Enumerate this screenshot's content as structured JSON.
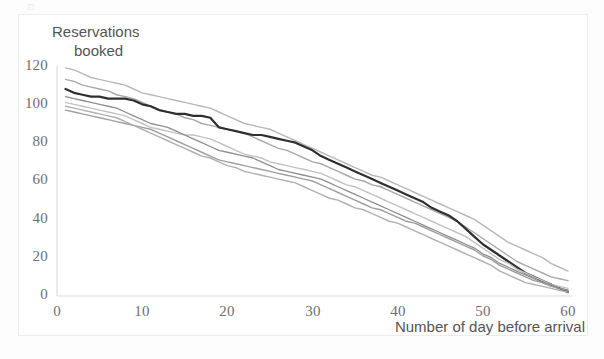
{
  "figure": {
    "scan_artifact": "□"
  },
  "chart_data": {
    "type": "line",
    "title": "Reservations booked",
    "title_line1": "Reservations",
    "title_line2": "booked",
    "xlabel": "Number of day before arrival",
    "ylabel": "Reservations booked",
    "xlim": [
      0,
      60
    ],
    "ylim": [
      0,
      120
    ],
    "xticks": [
      0,
      10,
      20,
      30,
      40,
      50,
      60
    ],
    "yticks": [
      0,
      20,
      40,
      60,
      80,
      100,
      120
    ],
    "grid": false,
    "legend": "none",
    "x": [
      1,
      2,
      3,
      4,
      5,
      6,
      7,
      8,
      9,
      10,
      11,
      12,
      13,
      14,
      15,
      16,
      17,
      18,
      19,
      20,
      21,
      22,
      23,
      24,
      25,
      26,
      27,
      28,
      29,
      30,
      31,
      32,
      33,
      34,
      35,
      36,
      37,
      38,
      39,
      40,
      41,
      42,
      43,
      44,
      45,
      46,
      47,
      48,
      49,
      50,
      51,
      52,
      53,
      54,
      55,
      56,
      57,
      58,
      59,
      60
    ],
    "colors": {
      "highlight": "#2f2f2f",
      "series_gray_1": "#b8b8b8",
      "series_gray_2": "#a8a8a8",
      "series_gray_3": "#c2c2c2",
      "series_gray_4": "#9e9e9e",
      "series_gray_5": "#b0b0b0",
      "series_gray_6": "#8f8f8f",
      "axis": "#d9d9d9",
      "tick_text": "#6e6e6e",
      "frame": "#ececec"
    },
    "series": [
      {
        "name": "booking curve 1 (upper)",
        "color": "#b8b8b8",
        "width": 1.4,
        "values": [
          119,
          118,
          116,
          114,
          113,
          112,
          111,
          110,
          108,
          106,
          105,
          104,
          103,
          102,
          101,
          100,
          99,
          98,
          96,
          94,
          92,
          90,
          89,
          88,
          87,
          85,
          83,
          81,
          79,
          77,
          75,
          73,
          71,
          69,
          67,
          65,
          63,
          62,
          60,
          58,
          56,
          54,
          52,
          50,
          48,
          46,
          44,
          42,
          40,
          37,
          34,
          31,
          28,
          26,
          24,
          22,
          20,
          17,
          15,
          13
        ]
      },
      {
        "name": "booking curve 2",
        "color": "#a8a8a8",
        "width": 1.4,
        "values": [
          113,
          112,
          110,
          109,
          108,
          107,
          105,
          104,
          103,
          101,
          99,
          97,
          96,
          95,
          93,
          92,
          90,
          89,
          88,
          87,
          86,
          85,
          83,
          81,
          79,
          77,
          76,
          74,
          72,
          70,
          69,
          67,
          65,
          63,
          61,
          60,
          58,
          57,
          55,
          53,
          51,
          49,
          47,
          45,
          43,
          41,
          39,
          36,
          33,
          30,
          27,
          24,
          21,
          18,
          16,
          14,
          12,
          10,
          9,
          8
        ]
      },
      {
        "name": "booking curve 3 (highlight / average)",
        "color": "#2f2f2f",
        "width": 2.2,
        "highlight": true,
        "values": [
          108,
          106,
          105,
          104,
          104,
          103,
          103,
          103,
          102,
          100,
          99,
          97,
          96,
          95,
          95,
          94,
          94,
          93,
          88,
          87,
          86,
          85,
          84,
          84,
          83,
          82,
          81,
          80,
          78,
          76,
          73,
          71,
          69,
          67,
          65,
          63,
          61,
          59,
          57,
          55,
          53,
          51,
          49,
          46,
          44,
          42,
          39,
          35,
          31,
          27,
          24,
          21,
          18,
          15,
          12,
          10,
          8,
          6,
          4,
          2
        ]
      },
      {
        "name": "booking curve 4",
        "color": "#c2c2c2",
        "width": 1.4,
        "values": [
          101,
          100,
          99,
          98,
          97,
          96,
          95,
          94,
          92,
          90,
          88,
          87,
          86,
          85,
          84,
          84,
          83,
          82,
          80,
          78,
          76,
          74,
          73,
          72,
          70,
          69,
          68,
          67,
          66,
          65,
          64,
          62,
          60,
          58,
          57,
          55,
          53,
          51,
          49,
          47,
          45,
          43,
          41,
          39,
          37,
          35,
          33,
          31,
          28,
          25,
          22,
          19,
          17,
          14,
          12,
          10,
          8,
          6,
          5,
          4
        ]
      },
      {
        "name": "booking curve 5",
        "color": "#9e9e9e",
        "width": 1.4,
        "values": [
          97,
          96,
          95,
          94,
          93,
          92,
          91,
          90,
          89,
          88,
          87,
          85,
          83,
          81,
          79,
          77,
          75,
          73,
          71,
          70,
          69,
          68,
          67,
          66,
          65,
          64,
          63,
          62,
          61,
          60,
          58,
          56,
          54,
          52,
          50,
          48,
          46,
          45,
          43,
          41,
          39,
          38,
          36,
          34,
          32,
          30,
          28,
          26,
          24,
          21,
          19,
          16,
          14,
          12,
          10,
          8,
          7,
          5,
          4,
          3
        ]
      },
      {
        "name": "booking curve 6",
        "color": "#b0b0b0",
        "width": 1.4,
        "values": [
          99,
          98,
          97,
          96,
          95,
          94,
          93,
          91,
          89,
          87,
          85,
          83,
          81,
          79,
          77,
          75,
          73,
          72,
          70,
          68,
          67,
          65,
          64,
          63,
          62,
          61,
          60,
          59,
          57,
          55,
          53,
          51,
          50,
          48,
          46,
          45,
          43,
          41,
          39,
          38,
          36,
          34,
          32,
          30,
          28,
          26,
          24,
          22,
          20,
          18,
          16,
          13,
          11,
          9,
          7,
          6,
          5,
          4,
          3,
          2
        ]
      },
      {
        "name": "booking curve 7",
        "color": "#8f8f8f",
        "width": 1.3,
        "values": [
          104,
          103,
          102,
          101,
          100,
          99,
          98,
          96,
          94,
          92,
          90,
          89,
          88,
          86,
          84,
          82,
          80,
          78,
          76,
          75,
          74,
          73,
          72,
          70,
          68,
          66,
          65,
          64,
          63,
          62,
          61,
          59,
          57,
          55,
          53,
          51,
          49,
          47,
          45,
          43,
          41,
          39,
          37,
          35,
          33,
          31,
          29,
          27,
          25,
          22,
          20,
          17,
          15,
          13,
          11,
          9,
          7,
          6,
          4,
          3
        ]
      }
    ]
  },
  "axes": {
    "yticks": [
      {
        "label": "120",
        "value": 120
      },
      {
        "label": "100",
        "value": 100
      },
      {
        "label": "80",
        "value": 80
      },
      {
        "label": "60",
        "value": 60
      },
      {
        "label": "40",
        "value": 40
      },
      {
        "label": "20",
        "value": 20
      },
      {
        "label": "0",
        "value": 0
      }
    ],
    "xticks": [
      {
        "label": "0",
        "value": 0
      },
      {
        "label": "10",
        "value": 10
      },
      {
        "label": "20",
        "value": 20
      },
      {
        "label": "30",
        "value": 30
      },
      {
        "label": "40",
        "value": 40
      },
      {
        "label": "50",
        "value": 50
      },
      {
        "label": "60",
        "value": 60
      }
    ]
  }
}
